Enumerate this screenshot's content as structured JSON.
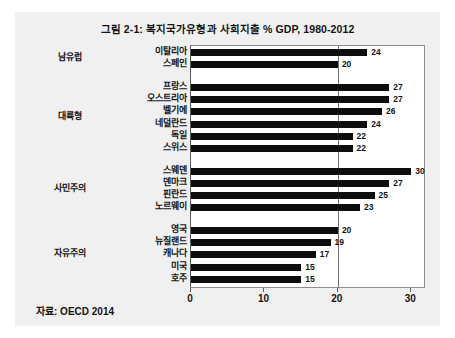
{
  "figure": {
    "title": "그림 2-1: 복지국가유형과  사회지출 % GDP, 1980-2012",
    "source_note": "자료: OECD 2014",
    "background_color": "#f0f0f0",
    "bar_color": "#0d0d0d",
    "gridline_color": "#707070"
  },
  "chart_data": {
    "type": "bar",
    "orientation": "horizontal",
    "title": "그림 2-1: 복지국가유형과  사회지출 % GDP, 1980-2012",
    "xlabel": "",
    "ylabel": "",
    "xlim": [
      0,
      32
    ],
    "xticks": [
      0,
      10,
      20,
      30
    ],
    "xtick_labels": [
      "0",
      "10",
      "20",
      "30"
    ],
    "grid": "vertical gridline at 20",
    "legend": "none",
    "value_labels_shown": true,
    "source": "자료: OECD 2014",
    "groups": [
      {
        "label": "남유럽",
        "categories": [
          "이탈리아",
          "스페인"
        ],
        "values": [
          24,
          20
        ]
      },
      {
        "label": "대륙형",
        "categories": [
          "프랑스",
          "오스트리아",
          "벨기에",
          "네덜란드",
          "독일",
          "스위스"
        ],
        "values": [
          27,
          27,
          26,
          24,
          22,
          22
        ]
      },
      {
        "label": "사민주의",
        "categories": [
          "스웨덴",
          "덴마크",
          "핀란드",
          "노르웨이"
        ],
        "values": [
          30,
          27,
          25,
          23
        ]
      },
      {
        "label": "자유주의",
        "categories": [
          "영국",
          "뉴질랜드",
          "캐나다",
          "미국",
          "호주"
        ],
        "values": [
          20,
          19,
          17,
          15,
          15
        ]
      }
    ],
    "categories": [
      "이탈리아",
      "스페인",
      "프랑스",
      "오스트리아",
      "벨기에",
      "네덜란드",
      "독일",
      "스위스",
      "스웨덴",
      "덴마크",
      "핀란드",
      "노르웨이",
      "영국",
      "뉴질랜드",
      "캐나다",
      "미국",
      "호주"
    ],
    "values": [
      24,
      20,
      27,
      27,
      26,
      24,
      22,
      22,
      30,
      27,
      25,
      23,
      20,
      19,
      17,
      15,
      15
    ]
  }
}
